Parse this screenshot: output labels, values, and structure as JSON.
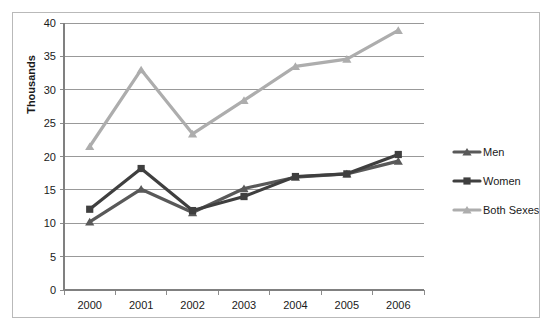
{
  "chart_data": {
    "type": "line",
    "title": "",
    "xlabel": "",
    "ylabel": "Thousands",
    "categories": [
      "2000",
      "2001",
      "2002",
      "2003",
      "2004",
      "2005",
      "2006"
    ],
    "series": [
      {
        "name": "Men",
        "values": [
          10.2,
          15.1,
          11.6,
          15.2,
          16.9,
          17.4,
          19.3
        ],
        "color": "#595959",
        "marker": "triangle"
      },
      {
        "name": "Women",
        "values": [
          12.1,
          18.2,
          11.9,
          14.0,
          17.0,
          17.4,
          20.3
        ],
        "color": "#3f3f3f",
        "marker": "square"
      },
      {
        "name": "Both Sexes",
        "values": [
          21.5,
          33.0,
          23.4,
          28.4,
          33.5,
          34.6,
          38.9
        ],
        "color": "#adadad",
        "marker": "triangle"
      }
    ],
    "ylim": [
      0,
      40
    ],
    "ytick_step": 5,
    "yticks": [
      "0",
      "5",
      "10",
      "15",
      "20",
      "25",
      "30",
      "35",
      "40"
    ],
    "grid": true,
    "grid_color": "#808080",
    "legend_position": "right",
    "axis_color": "#808080",
    "plot_background": "#ffffff",
    "border_color": "#b9b9b9"
  },
  "legend": {
    "entries": [
      "Men",
      "Women",
      "Both Sexes"
    ]
  }
}
